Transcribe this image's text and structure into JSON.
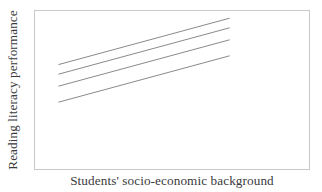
{
  "chart_data": {
    "type": "line",
    "title": "",
    "subtitle": "",
    "xlabel": "Students' socio-economic background",
    "ylabel": "Reading literacy performance",
    "grid": false,
    "legend": null,
    "axis_ticks": {
      "x": [],
      "y": []
    },
    "xlim": [
      0,
      100
    ],
    "ylim": [
      0,
      100
    ],
    "note": "Schematic illustration: four parallel upward-sloping lines of equal positive slope, vertically offset from one another; no tick labels or numeric scale shown.",
    "line_color": "#8a8a8c",
    "frame_color": "#c9c9cb",
    "background_color": "#ffffff",
    "series": [
      {
        "name": "line-1",
        "x": [
          8.5,
          70.5
        ],
        "y": [
          66.5,
          95.5
        ]
      },
      {
        "name": "line-2",
        "x": [
          8.5,
          70.5
        ],
        "y": [
          60.5,
          89.5
        ]
      },
      {
        "name": "line-3",
        "x": [
          8.5,
          70.5
        ],
        "y": [
          53.0,
          82.0
        ]
      },
      {
        "name": "line-4",
        "x": [
          8.5,
          70.5
        ],
        "y": [
          43.0,
          72.0
        ]
      }
    ]
  },
  "chart": {
    "ylabel": "Reading literacy performance",
    "xlabel": "Students' socio-economic background"
  }
}
